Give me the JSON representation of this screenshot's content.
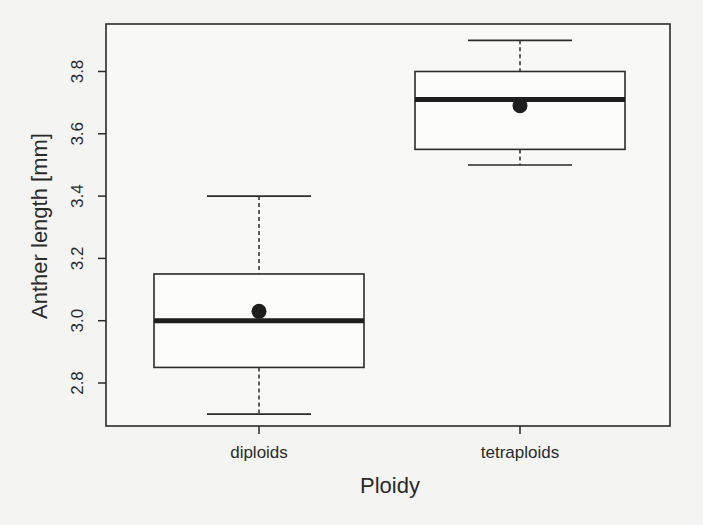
{
  "chart_data": {
    "type": "boxplot",
    "title": "",
    "xlabel": "Ploidy",
    "ylabel": "Anther length [mm]",
    "categories": [
      "diploids",
      "tetraploids"
    ],
    "ylim": [
      2.65,
      3.95
    ],
    "yticks": [
      2.8,
      3.0,
      3.2,
      3.4,
      3.6,
      3.8
    ],
    "ytick_labels": [
      "2.8",
      "3.0",
      "3.2",
      "3.4",
      "3.6",
      "3.8"
    ],
    "grid": false,
    "legend": null,
    "series": [
      {
        "name": "diploids",
        "whisker_low": 2.7,
        "q1": 2.85,
        "median": 3.0,
        "q3": 3.15,
        "whisker_high": 3.4,
        "mean": 3.03
      },
      {
        "name": "tetraploids",
        "whisker_low": 3.5,
        "q1": 3.55,
        "median": 3.71,
        "q3": 3.8,
        "whisker_high": 3.9,
        "mean": 3.69
      }
    ],
    "annotations": [
      "Filled circle marks group mean; thick line marks median"
    ]
  },
  "colors": {
    "ink": "#2b2b2b",
    "background": "#f4f4f2"
  }
}
